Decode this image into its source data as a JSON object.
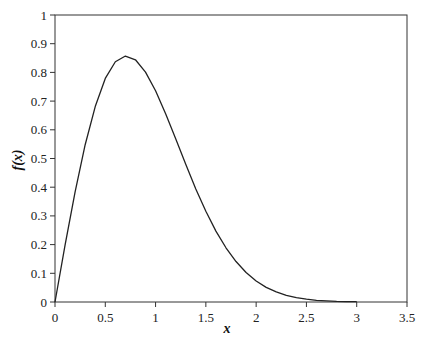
{
  "chart_data": {
    "type": "line",
    "title": "",
    "xlabel": "x",
    "ylabel": "f(x)",
    "xlim": [
      0,
      3.5
    ],
    "ylim": [
      0,
      1
    ],
    "x_ticks": [
      "0",
      "0.5",
      "1",
      "1.5",
      "2",
      "2.5",
      "3",
      "3.5"
    ],
    "y_ticks": [
      "0",
      "0.1",
      "0.2",
      "0.3",
      "0.4",
      "0.5",
      "0.6",
      "0.7",
      "0.8",
      "0.9",
      "1"
    ],
    "grid": false,
    "legend": null,
    "series": [
      {
        "name": "f(x)",
        "color": "#222222",
        "x": [
          0,
          0.1,
          0.2,
          0.3,
          0.4,
          0.5,
          0.6,
          0.7,
          0.8,
          0.9,
          1.0,
          1.1,
          1.2,
          1.3,
          1.4,
          1.5,
          1.6,
          1.7,
          1.8,
          1.9,
          2.0,
          2.1,
          2.2,
          2.3,
          2.4,
          2.5,
          2.6,
          2.7,
          2.8,
          2.9,
          3.0
        ],
        "y": [
          0,
          0.198,
          0.384,
          0.548,
          0.681,
          0.779,
          0.837,
          0.857,
          0.844,
          0.801,
          0.736,
          0.656,
          0.569,
          0.48,
          0.394,
          0.316,
          0.247,
          0.189,
          0.141,
          0.103,
          0.073,
          0.051,
          0.035,
          0.023,
          0.015,
          0.01,
          0.006,
          0.004,
          0.002,
          0.001,
          0.001
        ]
      }
    ]
  }
}
